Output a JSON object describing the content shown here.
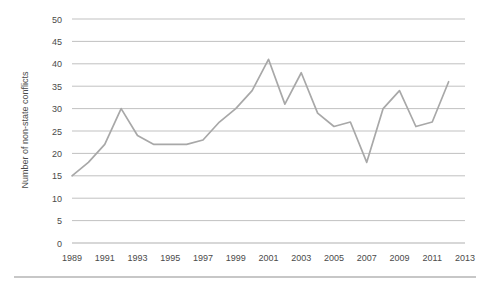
{
  "chart_data": {
    "type": "line",
    "title": "",
    "xlabel": "",
    "ylabel": "Number of non-state conflicts",
    "x": [
      1989,
      1990,
      1991,
      1992,
      1993,
      1994,
      1995,
      1996,
      1997,
      1998,
      1999,
      2000,
      2001,
      2002,
      2003,
      2004,
      2005,
      2006,
      2007,
      2008,
      2009,
      2010,
      2011,
      2012
    ],
    "values": [
      15,
      18,
      22,
      30,
      24,
      22,
      22,
      22,
      23,
      27,
      30,
      34,
      41,
      31,
      38,
      29,
      26,
      27,
      18,
      30,
      34,
      26,
      27,
      36
    ],
    "series": [
      {
        "name": "Number of non-state conflicts",
        "values": [
          15,
          18,
          22,
          30,
          24,
          22,
          22,
          22,
          23,
          27,
          30,
          34,
          41,
          31,
          38,
          29,
          26,
          27,
          18,
          30,
          34,
          26,
          27,
          36
        ]
      }
    ],
    "xlim": [
      1989,
      2013
    ],
    "ylim": [
      0,
      50
    ],
    "xticks": [
      "1989",
      "1991",
      "1993",
      "1995",
      "1997",
      "1999",
      "2001",
      "2003",
      "2005",
      "2007",
      "2009",
      "2011",
      "2013"
    ],
    "xtick_values": [
      1989,
      1991,
      1993,
      1995,
      1997,
      1999,
      2001,
      2003,
      2005,
      2007,
      2009,
      2011,
      2013
    ],
    "yticks": [
      "0",
      "5",
      "10",
      "15",
      "20",
      "25",
      "30",
      "35",
      "40",
      "45",
      "50"
    ],
    "ytick_values": [
      0,
      5,
      10,
      15,
      20,
      25,
      30,
      35,
      40,
      45,
      50
    ],
    "grid": true,
    "legend": false,
    "legend_position": "none",
    "line_color": "#a8a8a8",
    "grid_color": "#a6a6a6",
    "text_color": "#4a4a4a",
    "background_color": "#ffffff"
  },
  "figure": {
    "footer_rule_color": "#8f8f8f"
  }
}
